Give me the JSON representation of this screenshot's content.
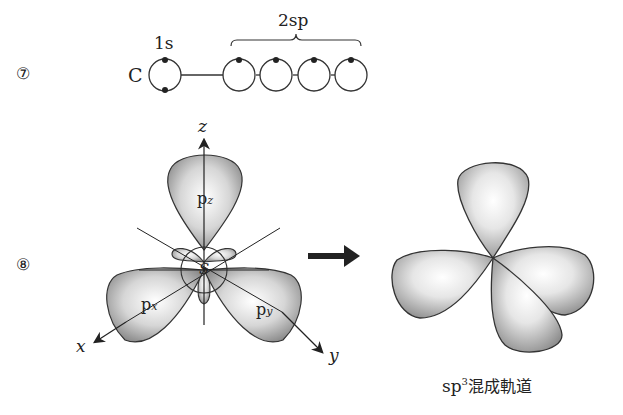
{
  "row7": {
    "marker": "⑦",
    "element": "C",
    "label_1s": "1s",
    "label_2sp": "2sp",
    "orbitals": [
      {
        "name": "1s",
        "electrons": 2
      },
      {
        "name": "2sp-1",
        "electrons": 1
      },
      {
        "name": "2sp-2",
        "electrons": 1
      },
      {
        "name": "2sp-3",
        "electrons": 1
      },
      {
        "name": "2sp-4",
        "electrons": 1
      }
    ]
  },
  "row8": {
    "marker": "⑧",
    "axes": {
      "z": "z",
      "x": "x",
      "y": "y"
    },
    "lobes": {
      "pz_main": "p",
      "pz_sub": "z",
      "px_main": "p",
      "px_sub": "x",
      "py_main": "p",
      "py_sub": "y",
      "s": "S"
    },
    "caption_main": "sp",
    "caption_sup": "3",
    "caption_rest": "混成軌道"
  }
}
